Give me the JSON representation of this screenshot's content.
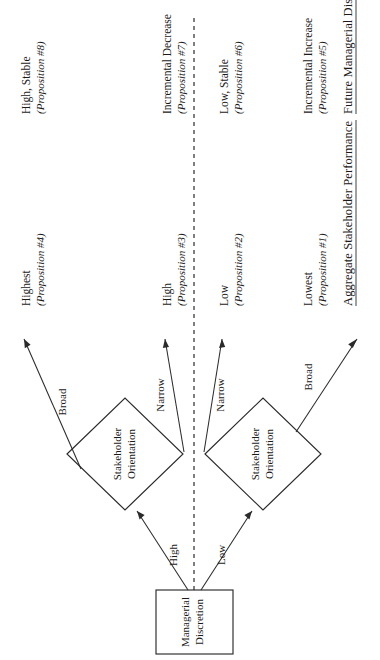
{
  "figure": {
    "orientation": "rotated-90",
    "ink_color": "#2b2b2b",
    "background": "#ffffff"
  },
  "columns": [
    {
      "id": "aggregate-stakeholder-performance",
      "label": "Aggregate Stakeholder Performance",
      "underlined": true
    },
    {
      "id": "future-managerial-discretion",
      "label": "Future Managerial Discretion",
      "underlined": true
    }
  ],
  "nodes": {
    "root": {
      "label_line1": "Managerial",
      "label_line2": "Discretion",
      "shape": "rectangle"
    },
    "branch_high": {
      "label_line1": "Stakeholder",
      "label_line2": "Orientation",
      "shape": "diamond"
    },
    "branch_low": {
      "label_line1": "Stakeholder",
      "label_line2": "Orientation",
      "shape": "diamond"
    }
  },
  "edges": {
    "root_to_high": {
      "label": "High"
    },
    "root_to_low": {
      "label": "Low"
    },
    "high_broad": {
      "label": "Broad"
    },
    "high_narrow": {
      "label": "Narrow"
    },
    "low_narrow": {
      "label": "Narrow"
    },
    "low_broad": {
      "label": "Broad"
    }
  },
  "outcomes": [
    {
      "id": "p4-p8",
      "branch": "high-discretion-broad",
      "performance": {
        "value": "Highest",
        "proposition": "(Proposition #4)"
      },
      "discretion": {
        "value": "High, Stable",
        "proposition": "(Proposition #8)"
      }
    },
    {
      "id": "p3-p7",
      "branch": "high-discretion-narrow",
      "performance": {
        "value": "High",
        "proposition": "(Proposition #3)"
      },
      "discretion": {
        "value": "Incremental Decrease",
        "proposition": "(Proposition #7)"
      }
    },
    {
      "id": "p2-p6",
      "branch": "low-discretion-narrow",
      "performance": {
        "value": "Low",
        "proposition": "(Proposition #2)"
      },
      "discretion": {
        "value": "Low, Stable",
        "proposition": "(Proposition #6)"
      }
    },
    {
      "id": "p1-p5",
      "branch": "low-discretion-broad",
      "performance": {
        "value": "Lowest",
        "proposition": "(Proposition #1)"
      },
      "discretion": {
        "value": "Incremental Increase",
        "proposition": "(Proposition #5)"
      }
    }
  ]
}
